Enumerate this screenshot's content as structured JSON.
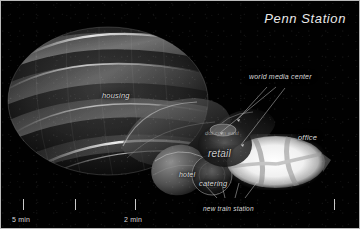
{
  "image": {
    "kind": "architectural-rendering",
    "subject": "Penn Station redevelopment massing diagram",
    "background_color": "#000000",
    "frame_color": "#b9b9b9",
    "label_color": "#d8d8d8"
  },
  "title": "Penn Station",
  "labels": {
    "housing": "housing",
    "hotel": "hotel",
    "catering": "catering",
    "retail": "retail",
    "office": "office",
    "world_media_center": "world media center",
    "new_train_station": "new train station",
    "dot_com": "dot.com east"
  },
  "scale": {
    "unit_left": "5 min",
    "unit_right": "2 min",
    "ticks": [
      {
        "label": "5 min",
        "x": 22
      },
      {
        "label": "",
        "x": 74
      },
      {
        "label": "2 min",
        "x": 134
      },
      {
        "label": "",
        "x": 333
      }
    ]
  },
  "volumes": [
    {
      "name": "housing-dome",
      "color": "#6f6f6f",
      "glow": "#d9d9d9"
    },
    {
      "name": "hotel-mass",
      "color": "#7a7a7a",
      "glow": "#cdcdcd"
    },
    {
      "name": "catering-mass",
      "color": "#6b6b6b",
      "glow": "#c4c4c4"
    },
    {
      "name": "retail-mass",
      "color": "#555555",
      "glow": "#bdbdbd"
    },
    {
      "name": "office-ellipse",
      "color": "#f3f3f3",
      "glow": "#ffffff"
    },
    {
      "name": "world-media-center-mass",
      "color": "#8a8a8a",
      "glow": "#e4e4e4"
    }
  ]
}
